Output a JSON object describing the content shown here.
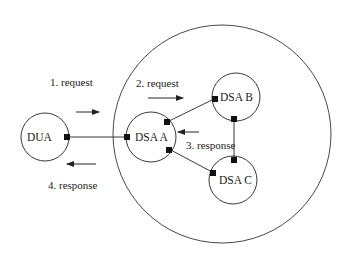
{
  "diagram": {
    "nodes": [
      {
        "id": "dua",
        "label": "DUA"
      },
      {
        "id": "dsa_a",
        "label": "DSA  A"
      },
      {
        "id": "dsa_b",
        "label": "DSA B"
      },
      {
        "id": "dsa_c",
        "label": "DSA C"
      }
    ],
    "steps": [
      {
        "label": "1. request"
      },
      {
        "label": "2. request"
      },
      {
        "label": "3. response"
      },
      {
        "label": "4. response"
      }
    ],
    "colors": {
      "stroke": "#222222",
      "background": "#ffffff"
    }
  }
}
